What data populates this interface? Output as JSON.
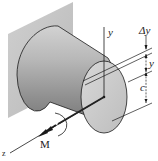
{
  "diagram": {
    "type": "beam-bending-cylinder",
    "labels": {
      "y_axis": "y",
      "delta_y": "Δy",
      "y_dim": "y",
      "c_dim": "c",
      "moment": "M",
      "z_axis": "z"
    },
    "colors": {
      "wall": "#c8c8c8",
      "cylinder_light": "#e6e6e6",
      "cylinder_dark": "#8a8a8a",
      "lines": "#1a1a1a"
    }
  }
}
